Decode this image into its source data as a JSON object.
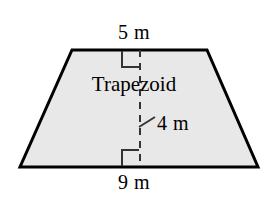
{
  "figure": {
    "kind": "geometry-diagram",
    "shape_name": "Trapezoid",
    "background_color": "#ffffff",
    "fill_color": "#e8e8e8",
    "stroke_color": "#000000",
    "labels": {
      "top_base": "5 m",
      "bottom_base": "9 m",
      "height": "4 m",
      "shape": "Trapezoid"
    },
    "markers": {
      "right_angle_top": "right-angle-marker",
      "right_angle_bottom": "right-angle-marker",
      "height_line": "dashed-height-line",
      "height_leader": "leader-line"
    }
  }
}
